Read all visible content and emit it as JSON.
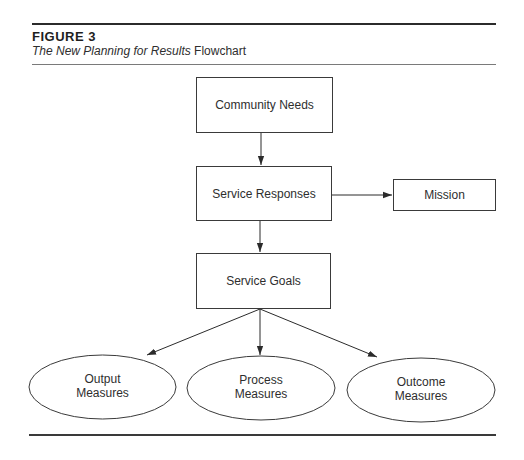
{
  "figure": {
    "label": "FIGURE 3",
    "caption_italic": "The New Planning for Results",
    "caption_plain": " Flowchart"
  },
  "nodes": {
    "community_needs": {
      "label": "Community Needs",
      "shape": "rectangle"
    },
    "service_responses": {
      "label": "Service Responses",
      "shape": "rectangle"
    },
    "mission": {
      "label": "Mission",
      "shape": "rectangle"
    },
    "service_goals": {
      "label": "Service Goals",
      "shape": "rectangle"
    },
    "output_measures": {
      "line1": "Output",
      "line2": "Measures",
      "shape": "ellipse"
    },
    "process_measures": {
      "line1": "Process",
      "line2": "Measures",
      "shape": "ellipse"
    },
    "outcome_measures": {
      "line1": "Outcome",
      "line2": "Measures",
      "shape": "ellipse"
    }
  },
  "edges": [
    {
      "from": "Community Needs",
      "to": "Service Responses"
    },
    {
      "from": "Service Responses",
      "to": "Mission"
    },
    {
      "from": "Service Responses",
      "to": "Service Goals"
    },
    {
      "from": "Service Goals",
      "to": "Output Measures"
    },
    {
      "from": "Service Goals",
      "to": "Process Measures"
    },
    {
      "from": "Service Goals",
      "to": "Outcome Measures"
    }
  ],
  "colors": {
    "stroke": "#3a3a3a",
    "text": "#2e2e2e",
    "background": "#ffffff"
  }
}
